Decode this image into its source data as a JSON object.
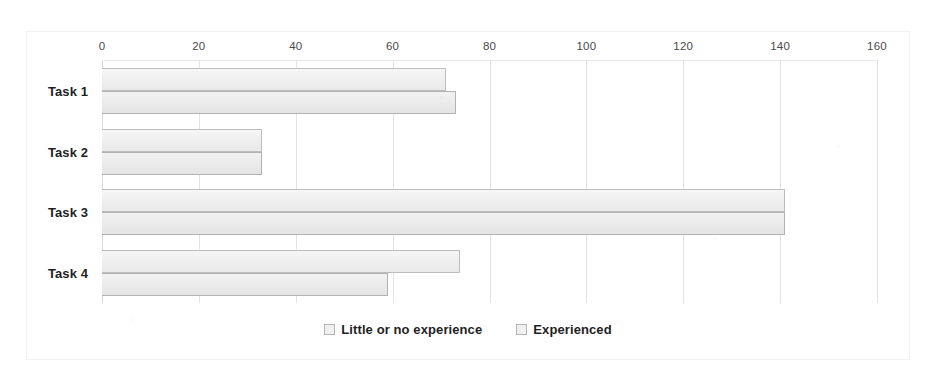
{
  "chart_data": {
    "type": "bar",
    "orientation": "horizontal",
    "title": "",
    "xlabel": "",
    "ylabel": "",
    "categories": [
      "Task 1",
      "Task 2",
      "Task 3",
      "Task 4"
    ],
    "series": [
      {
        "name": "Little or no experience",
        "values": [
          71,
          33,
          141,
          74
        ]
      },
      {
        "name": "Experienced",
        "values": [
          73,
          33,
          141,
          59
        ]
      }
    ],
    "xlim": [
      0,
      160
    ],
    "xticks": [
      0,
      20,
      40,
      60,
      80,
      100,
      120,
      140,
      160
    ],
    "xtick_labels": [
      "0",
      "20",
      "40",
      "60",
      "80",
      "100",
      "120",
      "140",
      "160"
    ],
    "grid": true,
    "grid_axis": "x",
    "legend": {
      "position": "bottom-center",
      "entries": [
        {
          "label": "Little or no experience",
          "swatch": "legend-swatch-icon"
        },
        {
          "label": "Experienced",
          "swatch": "legend-swatch-icon"
        }
      ]
    },
    "colors": {
      "series_0_fill": "#efefef",
      "series_0_border": "#bdbdbd",
      "series_1_fill": "#ebebeb",
      "series_1_border": "#b2b2b2",
      "gridline": "#e3e3e3",
      "frame_border": "#f2f2f2",
      "background": "#ffffff",
      "text": "#1f1f1f"
    }
  }
}
